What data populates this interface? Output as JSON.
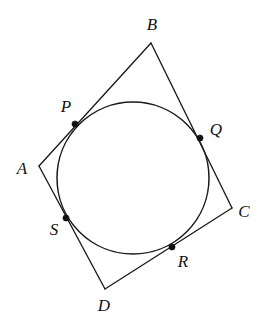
{
  "figure": {
    "kind": "geometry-diagram",
    "width": 267,
    "height": 332,
    "background_color": "#ffffff",
    "stroke_color": "#1a1a1a",
    "label_color": "#121212"
  },
  "circle": {
    "center_x": 133,
    "center_y": 178,
    "radius": 76
  },
  "vertices": [
    {
      "name": "A",
      "label": "A",
      "x": 39,
      "y": 166,
      "label_x": 22,
      "label_y": 168
    },
    {
      "name": "B",
      "label": "B",
      "x": 151,
      "y": 43,
      "label_x": 152,
      "label_y": 24
    },
    {
      "name": "C",
      "label": "C",
      "x": 232,
      "y": 208,
      "label_x": 244,
      "label_y": 211
    },
    {
      "name": "D",
      "label": "D",
      "x": 105,
      "y": 289,
      "label_x": 104,
      "label_y": 305
    }
  ],
  "tangent_points": [
    {
      "name": "P",
      "label": "P",
      "x": 75,
      "y": 124,
      "label_x": 66,
      "label_y": 106,
      "on_side": "AB"
    },
    {
      "name": "Q",
      "label": "Q",
      "x": 200,
      "y": 138,
      "label_x": 216,
      "label_y": 129,
      "on_side": "BC"
    },
    {
      "name": "R",
      "label": "R",
      "x": 172,
      "y": 247,
      "label_x": 183,
      "label_y": 261,
      "on_side": "CD"
    },
    {
      "name": "S",
      "label": "S",
      "x": 66,
      "y": 218,
      "label_x": 54,
      "label_y": 229,
      "on_side": "DA"
    }
  ],
  "sides": [
    {
      "name": "AB",
      "from": "A",
      "to": "B"
    },
    {
      "name": "BC",
      "from": "B",
      "to": "C"
    },
    {
      "name": "CD",
      "from": "C",
      "to": "D"
    },
    {
      "name": "DA",
      "from": "D",
      "to": "A"
    }
  ],
  "dot_radius": 3.1
}
